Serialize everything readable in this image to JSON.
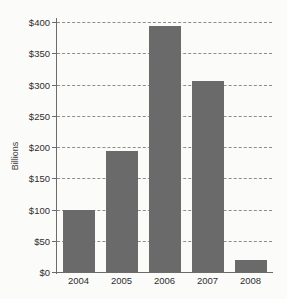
{
  "chart_data": {
    "type": "bar",
    "title": "",
    "subtitle": "",
    "xlabel": "",
    "ylabel": "Billions",
    "categories": [
      "2004",
      "2005",
      "2006",
      "2007",
      "2008"
    ],
    "values": [
      100,
      193,
      394,
      306,
      20
    ],
    "ylim": [
      0,
      400
    ],
    "y_ticks": [
      0,
      50,
      100,
      150,
      200,
      250,
      300,
      350,
      400
    ],
    "y_tick_labels": [
      "$0",
      "$50",
      "$100",
      "$150",
      "$200",
      "$250",
      "$300",
      "$350",
      "$400"
    ],
    "grid": true,
    "grid_style": "dashed",
    "legend": false,
    "legend_position": "none",
    "bar_color": "#6a6a6a",
    "grid_color": "#8d8d8d",
    "axis_color": "#6b6b6b",
    "background_color": "#fbfbfa",
    "text_color": "#2e2e2e"
  }
}
